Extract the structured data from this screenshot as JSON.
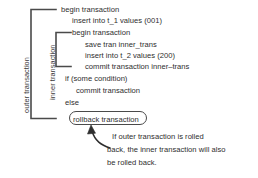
{
  "diagram": {
    "line_color": "#4a4a4a",
    "text_color": "#2e2e2e",
    "background": "#ffffff",
    "scope_labels": {
      "outer": "outer transaction",
      "inner": "inner transaction"
    },
    "code_lines": [
      {
        "text": "begin transaction",
        "indent": 0
      },
      {
        "text": "insert into t_1 values (001)",
        "indent": 1
      },
      {
        "text": "begin transaction",
        "indent": 1
      },
      {
        "text": "save tran inner_trans",
        "indent": 2
      },
      {
        "text": "insert into t_2 values (200)",
        "indent": 2
      },
      {
        "text": "commit transaction inner–trans",
        "indent": 2
      },
      {
        "text": "if (some condition)",
        "indent": 0
      },
      {
        "text": "commit transaction",
        "indent": 1
      },
      {
        "text": "else",
        "indent": 0
      }
    ],
    "highlighted_statement": "rollback transaction",
    "caption_lines": [
      "If outer transaction is rolled",
      "back, the inner transaction will also",
      "be rolled back."
    ]
  }
}
